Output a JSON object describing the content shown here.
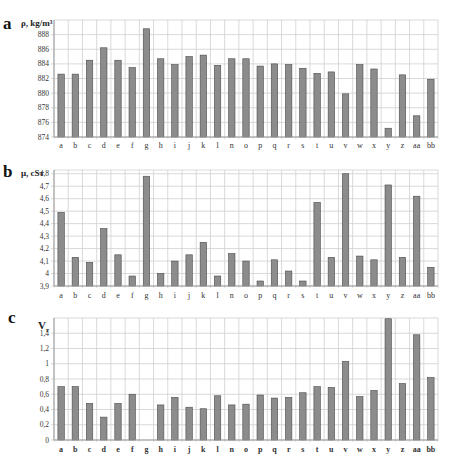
{
  "chart_data": [
    {
      "panel": "a",
      "type": "bar",
      "title": "",
      "ylabel": "ρ, kg/m³",
      "xlabel": "",
      "categories": [
        "a",
        "b",
        "c",
        "d",
        "e",
        "f",
        "g",
        "h",
        "i",
        "j",
        "k",
        "l",
        "n",
        "o",
        "p",
        "q",
        "r",
        "s",
        "t",
        "u",
        "v",
        "w",
        "x",
        "y",
        "z",
        "aa",
        "bb"
      ],
      "values": [
        882.6,
        882.6,
        884.5,
        886.2,
        884.5,
        883.5,
        888.8,
        884.7,
        883.9,
        885.0,
        885.2,
        883.8,
        884.7,
        884.7,
        883.7,
        884.0,
        883.9,
        883.4,
        882.7,
        882.9,
        879.9,
        883.9,
        883.3,
        875.2,
        882.5,
        876.9,
        881.9
      ],
      "ylim": [
        874,
        890
      ],
      "yticks": [
        "874",
        "876",
        "878",
        "880",
        "882",
        "884",
        "886",
        "888"
      ],
      "grid": true,
      "legend": "none"
    },
    {
      "panel": "b",
      "type": "bar",
      "title": "",
      "ylabel": "μ, cSт",
      "xlabel": "",
      "categories": [
        "a",
        "b",
        "c",
        "d",
        "e",
        "f",
        "g",
        "h",
        "i",
        "j",
        "k",
        "l",
        "n",
        "o",
        "p",
        "q",
        "r",
        "s",
        "t",
        "u",
        "v",
        "w",
        "x",
        "y",
        "z",
        "aa",
        "bb"
      ],
      "values": [
        4.49,
        4.13,
        4.09,
        4.36,
        4.15,
        3.98,
        4.78,
        4.0,
        4.1,
        4.15,
        4.25,
        3.98,
        4.16,
        4.1,
        3.94,
        4.11,
        4.02,
        3.94,
        4.57,
        4.13,
        4.8,
        4.14,
        4.11,
        4.71,
        4.13,
        4.62,
        4.05
      ],
      "ylim": [
        3.9,
        4.83
      ],
      "yticks": [
        "3,9",
        "4",
        "4,1",
        "4,2",
        "4,3",
        "4,4",
        "4,5",
        "4,6",
        "4,7",
        "4,8"
      ],
      "grid": true,
      "legend": "none"
    },
    {
      "panel": "c",
      "type": "bar",
      "title": "",
      "ylabel": "Vr",
      "xlabel": "",
      "categories": [
        "a",
        "b",
        "c",
        "d",
        "e",
        "f",
        "g",
        "h",
        "i",
        "j",
        "k",
        "l",
        "n",
        "o",
        "p",
        "q",
        "r",
        "s",
        "t",
        "u",
        "v",
        "w",
        "x",
        "y",
        "z",
        "aa",
        "bb"
      ],
      "values": [
        0.7,
        0.7,
        0.48,
        0.3,
        0.48,
        0.6,
        0.0,
        0.46,
        0.56,
        0.43,
        0.41,
        0.58,
        0.46,
        0.47,
        0.59,
        0.55,
        0.56,
        0.62,
        0.7,
        0.69,
        1.03,
        0.57,
        0.65,
        1.59,
        0.74,
        1.38,
        0.82
      ],
      "ylim": [
        0,
        1.6
      ],
      "yticks": [
        "0",
        "0,2",
        "0,4",
        "0,6",
        "0,8",
        "1",
        "1,2",
        "1,4"
      ],
      "grid": true,
      "legend": "none"
    }
  ],
  "panels": {
    "a": {
      "letter": "a",
      "ylabel": "ρ, kg/m³"
    },
    "b": {
      "letter": "b",
      "ylabel": "μ, cSт"
    },
    "c": {
      "letter": "c",
      "ylabel_main": "V",
      "ylabel_sub": "r"
    }
  },
  "colors": {
    "bar_fill": "#8c8c8c",
    "bar_stroke": "#4a4a4a",
    "grid": "#cfcfcf",
    "axis": "#9a9a9a",
    "text": "#333333"
  }
}
